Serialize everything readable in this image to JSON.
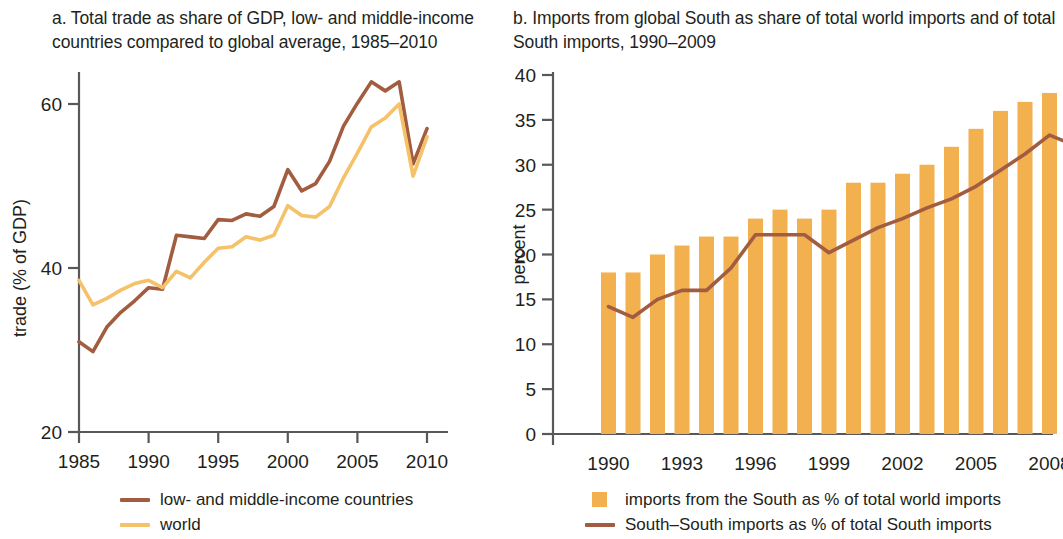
{
  "figure": {
    "background": "#ffffff",
    "panels": [
      "a",
      "b"
    ]
  },
  "panel_a": {
    "title": "a.  Total trade as share of GDP, low- and middle-income\ncountries compared to global average, 1985–2010",
    "ylabel": "trade (% of GDP)",
    "y_ticks": [
      "20",
      "40",
      "60"
    ],
    "x_ticks": [
      "1985",
      "1990",
      "1995",
      "2000",
      "2005",
      "2010"
    ],
    "legend": [
      {
        "label": "low- and middle-income countries",
        "color": "#a25c40",
        "marker": "line"
      },
      {
        "label": "world",
        "color": "#f5c269",
        "marker": "line"
      }
    ]
  },
  "panel_b": {
    "title": "b.  Imports from global South as share of total world imports and of  total\nSouth imports, 1990–2009",
    "ylabel": "percent",
    "y_ticks": [
      "0",
      "5",
      "10",
      "15",
      "20",
      "25",
      "30",
      "35",
      "40"
    ],
    "x_ticks": [
      "1990",
      "1993",
      "1996",
      "1999",
      "2002",
      "2005",
      "2008"
    ],
    "legend": [
      {
        "label": "imports from the South as % of total world imports",
        "color": "#f2b04e",
        "marker": "box"
      },
      {
        "label": "South–South imports as % of total South imports",
        "color": "#a25c40",
        "marker": "line"
      }
    ]
  },
  "chart_data": [
    {
      "type": "line",
      "panel": "a",
      "title": "a.  Total trade as share of GDP, low- and middle-income countries compared to global average, 1985–2010",
      "xlabel": "",
      "ylabel": "trade (% of GDP)",
      "xlim": [
        1985,
        2010
      ],
      "ylim": [
        20,
        65
      ],
      "yticks": [
        20,
        40,
        60
      ],
      "xticks": [
        1985,
        1990,
        1995,
        2000,
        2005,
        2010
      ],
      "grid": false,
      "legend_position": "below",
      "x": [
        1985,
        1986,
        1987,
        1988,
        1989,
        1990,
        1991,
        1992,
        1993,
        1994,
        1995,
        1996,
        1997,
        1998,
        1999,
        2000,
        2001,
        2002,
        2003,
        2004,
        2005,
        2006,
        2007,
        2008,
        2009,
        2010
      ],
      "series": [
        {
          "name": "low- and middle-income countries",
          "color": "#a25c40",
          "values": [
            31.0,
            29.8,
            32.8,
            34.6,
            36.0,
            37.6,
            37.4,
            44.0,
            43.8,
            43.6,
            45.9,
            45.8,
            46.6,
            46.3,
            47.5,
            52.0,
            49.4,
            50.3,
            53.0,
            57.3,
            60.1,
            62.7,
            61.6,
            62.7,
            52.7,
            57.0
          ]
        },
        {
          "name": "world",
          "color": "#f5c269",
          "values": [
            38.5,
            35.5,
            36.3,
            37.3,
            38.1,
            38.5,
            37.6,
            39.6,
            38.8,
            40.7,
            42.4,
            42.6,
            43.8,
            43.4,
            44.0,
            47.6,
            46.4,
            46.2,
            47.5,
            51.0,
            54.0,
            57.2,
            58.3,
            60.0,
            51.2,
            56.0
          ]
        }
      ]
    },
    {
      "type": "bar",
      "panel": "b",
      "title": "b.  Imports from global South as share of total world imports and of  total South imports, 1990–2009",
      "xlabel": "",
      "ylabel": "percent",
      "ylim": [
        0,
        40
      ],
      "yticks": [
        0,
        5,
        10,
        15,
        20,
        25,
        30,
        35,
        40
      ],
      "xticks": [
        1990,
        1993,
        1996,
        1999,
        2002,
        2005,
        2008
      ],
      "grid": false,
      "legend_position": "below",
      "categories": [
        1990,
        1991,
        1992,
        1993,
        1994,
        1995,
        1996,
        1997,
        1998,
        1999,
        2000,
        2001,
        2002,
        2003,
        2004,
        2005,
        2006,
        2007,
        2008,
        2009
      ],
      "series": [
        {
          "name": "imports from the South as % of total world imports",
          "type": "bar",
          "color": "#f2b04e",
          "values": [
            18,
            18,
            20,
            21,
            22,
            22,
            24,
            25,
            24,
            25,
            28,
            28,
            29,
            30,
            32,
            34,
            36,
            37,
            38,
            38
          ]
        },
        {
          "name": "South–South imports as % of total South imports",
          "type": "line",
          "color": "#a25c40",
          "values": [
            14.2,
            13.0,
            15.0,
            16.0,
            16.0,
            18.5,
            22.2,
            22.2,
            22.2,
            20.2,
            21.6,
            23.0,
            24.0,
            25.2,
            26.2,
            27.6,
            29.4,
            31.2,
            33.3,
            32.2
          ]
        }
      ]
    }
  ]
}
